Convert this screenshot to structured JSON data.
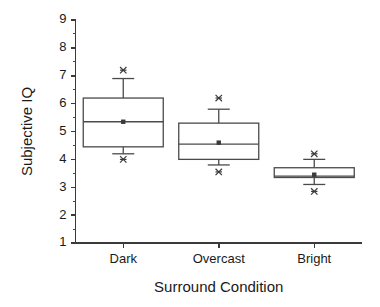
{
  "chart_data": {
    "type": "box",
    "title": "",
    "xlabel": "Surround Condition",
    "ylabel": "Subjective IQ",
    "categories": [
      "Dark",
      "Overcast",
      "Bright"
    ],
    "ylim": [
      1,
      9
    ],
    "ytick_labels": [
      "1",
      "2",
      "3",
      "4",
      "5",
      "6",
      "7",
      "8",
      "9"
    ],
    "ytick_values": [
      1,
      2,
      3,
      4,
      5,
      6,
      7,
      8,
      9
    ],
    "minor_ticks_per_interval": 1,
    "grid": false,
    "legend": null,
    "boxes": [
      {
        "category": "Dark",
        "whisker_low": 4.2,
        "q1": 4.45,
        "median": 5.35,
        "q3": 6.2,
        "whisker_high": 6.9,
        "mean": 5.35,
        "outliers": [
          7.2,
          4.0
        ]
      },
      {
        "category": "Overcast",
        "whisker_low": 3.8,
        "q1": 4.0,
        "median": 4.55,
        "q3": 5.3,
        "whisker_high": 5.8,
        "mean": 4.6,
        "outliers": [
          6.2,
          3.55
        ]
      },
      {
        "category": "Bright",
        "whisker_low": 3.1,
        "q1": 3.35,
        "median": 3.4,
        "q3": 3.7,
        "whisker_high": 4.0,
        "mean": 3.45,
        "outliers": [
          4.2,
          2.85
        ]
      }
    ],
    "colors": {
      "axis": "#3a3a3a",
      "box_stroke": "#4a4a4a",
      "box_fill": "#ffffff",
      "marker": "#3a3a3a",
      "background": "#ffffff"
    }
  }
}
